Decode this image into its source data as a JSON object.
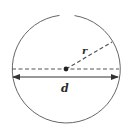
{
  "diagram": {
    "title": "",
    "shape": "circle",
    "labels": {
      "radius": "r",
      "diameter": "d"
    },
    "colors": {
      "stroke": "#555555",
      "text": "#2a2a2a",
      "background": "#ffffff"
    }
  }
}
